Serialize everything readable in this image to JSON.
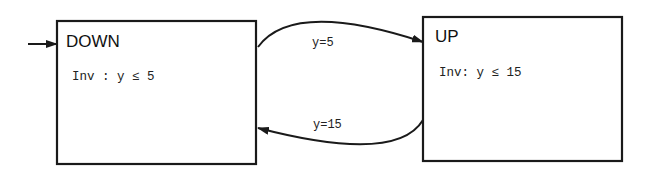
{
  "diagram": {
    "type": "hybrid-automaton",
    "states": [
      {
        "id": "down",
        "name": "DOWN",
        "invariant": "Inv : y ≤ 5",
        "initial": true
      },
      {
        "id": "up",
        "name": "UP",
        "invariant": "Inv: y ≤ 15",
        "initial": false
      }
    ],
    "transitions": [
      {
        "from": "DOWN",
        "to": "UP",
        "guard": "y=5"
      },
      {
        "from": "UP",
        "to": "DOWN",
        "guard": "y=15"
      }
    ],
    "colors": {
      "stroke": "#1a1a1a",
      "text": "#111111",
      "background": "#ffffff"
    }
  }
}
